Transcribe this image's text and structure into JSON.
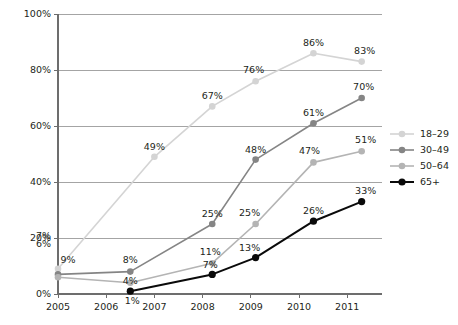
{
  "chart_data": {
    "type": "line",
    "title": "",
    "subtitle": "",
    "xlabel": "",
    "ylabel": "",
    "x": [
      2005,
      2006,
      2007,
      2008,
      2009,
      2010,
      2011
    ],
    "xlim": [
      2005,
      2011
    ],
    "ylim": [
      0,
      100
    ],
    "yticks": [
      0,
      20,
      40,
      60,
      80,
      100
    ],
    "ytick_labels": [
      "0%",
      "20%",
      "40%",
      "60%",
      "80%",
      "100%"
    ],
    "extra_ytick_labels": [
      "6%",
      "7%"
    ],
    "xtick_labels": [
      "2005",
      "2006",
      "2007",
      "2008",
      "2009",
      "2010",
      "2011"
    ],
    "grid": "horizontal",
    "legend_position": "right",
    "series": [
      {
        "name": "18–29",
        "color": "#d4d4d4",
        "points": [
          {
            "x": 2005.0,
            "y": 9,
            "label": "9%"
          },
          {
            "x": 2007.0,
            "y": 49,
            "label": "49%"
          },
          {
            "x": 2008.2,
            "y": 67,
            "label": "67%"
          },
          {
            "x": 2009.1,
            "y": 76,
            "label": "76%"
          },
          {
            "x": 2010.3,
            "y": 86,
            "label": "86%"
          },
          {
            "x": 2011.3,
            "y": 83,
            "label": "83%"
          }
        ]
      },
      {
        "name": "30–49",
        "color": "#858585",
        "points": [
          {
            "x": 2005.0,
            "y": 7,
            "label": "7%"
          },
          {
            "x": 2006.5,
            "y": 8,
            "label": "8%"
          },
          {
            "x": 2008.2,
            "y": 25,
            "label": "25%"
          },
          {
            "x": 2009.1,
            "y": 48,
            "label": "48%"
          },
          {
            "x": 2010.3,
            "y": 61,
            "label": "61%"
          },
          {
            "x": 2011.3,
            "y": 70,
            "label": "70%"
          }
        ]
      },
      {
        "name": "50–64",
        "color": "#b4b4b4",
        "points": [
          {
            "x": 2005.0,
            "y": 6,
            "label": "6%"
          },
          {
            "x": 2006.5,
            "y": 4,
            "label": "4%"
          },
          {
            "x": 2008.2,
            "y": 11,
            "label": "11%"
          },
          {
            "x": 2009.1,
            "y": 25,
            "label": "25%"
          },
          {
            "x": 2010.3,
            "y": 47,
            "label": "47%"
          },
          {
            "x": 2011.3,
            "y": 51,
            "label": "51%"
          }
        ]
      },
      {
        "name": "65+",
        "color": "#0a0a0a",
        "points": [
          {
            "x": 2006.5,
            "y": 1,
            "label": "1%"
          },
          {
            "x": 2008.2,
            "y": 7,
            "label": "7%"
          },
          {
            "x": 2009.1,
            "y": 13,
            "label": "13%"
          },
          {
            "x": 2010.3,
            "y": 26,
            "label": "26%"
          },
          {
            "x": 2011.3,
            "y": 33,
            "label": "33%"
          }
        ]
      }
    ],
    "legend": [
      {
        "label": "18–29",
        "color": "#d4d4d4"
      },
      {
        "label": "30–49",
        "color": "#858585"
      },
      {
        "label": "50–64",
        "color": "#b4b4b4"
      },
      {
        "label": "65+",
        "color": "#0a0a0a"
      }
    ]
  },
  "layout": {
    "plot_left": 58,
    "plot_right": 382,
    "plot_top": 14,
    "plot_bottom": 294,
    "x_step": 48.2,
    "legend_x": 390,
    "legend_y_start": 134,
    "legend_row_height": 16
  }
}
